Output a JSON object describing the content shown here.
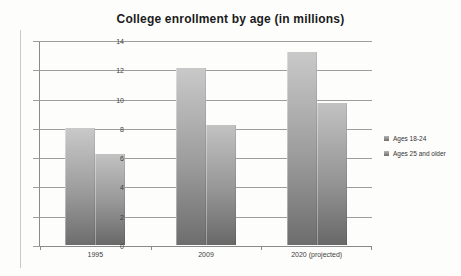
{
  "chart_data": {
    "type": "bar",
    "title": "College enrollment by age (in millions)",
    "categories": [
      "1995",
      "2009",
      "2020 (projected)"
    ],
    "series": [
      {
        "name": "Ages 18-24",
        "values": [
          8.0,
          12.1,
          13.2
        ]
      },
      {
        "name": "Ages 25 and older",
        "values": [
          6.2,
          8.2,
          9.7
        ]
      }
    ],
    "xlabel": "",
    "ylabel": "",
    "ylim": [
      0,
      14
    ],
    "y_ticks": [
      0,
      2,
      4,
      6,
      8,
      10,
      12,
      14
    ],
    "grid": true,
    "legend_position": "right"
  },
  "colors": {
    "bar_top": "#c9c9c9",
    "bar_bottom": "#6d6d6d",
    "gridline": "#9d9d9d",
    "axis": "#8a8a8a",
    "label_text": "#3d3d3d",
    "title_text": "#1b1b1b",
    "background": "#fdfdfc"
  }
}
